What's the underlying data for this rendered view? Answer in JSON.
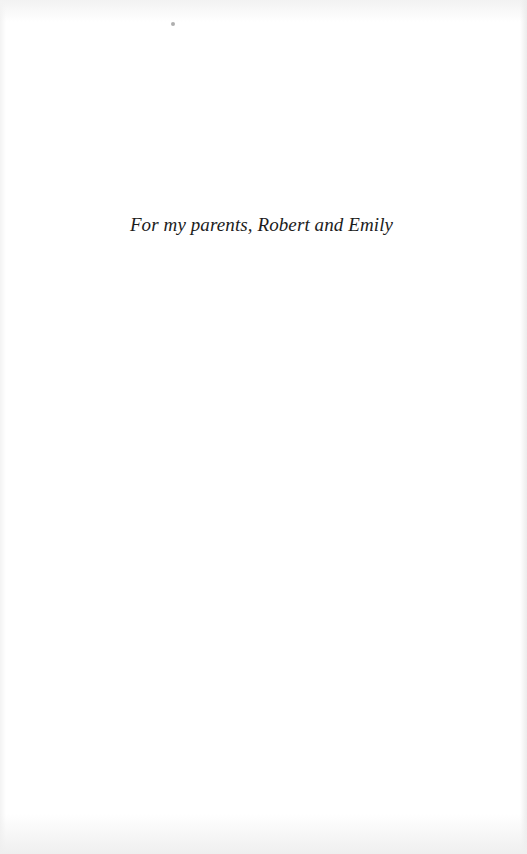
{
  "page": {
    "type": "dedication",
    "dedication_text": "For my parents, Robert and Emily",
    "colors": {
      "background": "#ffffff",
      "text": "#1c1c1c"
    }
  }
}
